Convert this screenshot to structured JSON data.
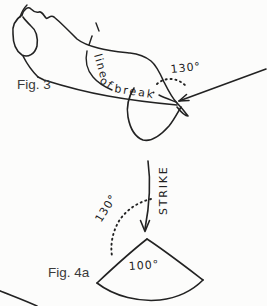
{
  "figure3": {
    "label": "Fig. 3",
    "break_line_words": [
      "line",
      "of",
      "break"
    ],
    "approach_angle": "130°"
  },
  "figure4a": {
    "label": "Fig. 4a",
    "strike_label": "STRIKE",
    "rotation_angle": "130°",
    "sector_angle": "100°"
  },
  "colors": {
    "ink": "#222222",
    "paper": "#fcfcfb",
    "caption": "#3a3a3a"
  }
}
